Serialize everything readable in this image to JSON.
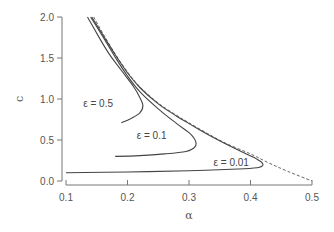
{
  "chart_data": {
    "type": "line",
    "title": "",
    "xlabel": "α",
    "ylabel": "c",
    "xlim": [
      0.1,
      0.5
    ],
    "ylim": [
      0.0,
      2.0
    ],
    "xticks": [
      "0.1",
      "0.2",
      "0.3",
      "0.4",
      "0.5"
    ],
    "yticks": [
      "0.0",
      "0.5",
      "1.0",
      "1.5",
      "2.0"
    ],
    "grid": false,
    "legend": "none",
    "series": [
      {
        "name": "limit",
        "style": "dashed",
        "points": [
          [
            0.145,
            2.0
          ],
          [
            0.16,
            1.8
          ],
          [
            0.18,
            1.55
          ],
          [
            0.2,
            1.33
          ],
          [
            0.22,
            1.15
          ],
          [
            0.25,
            0.95
          ],
          [
            0.28,
            0.8
          ],
          [
            0.3,
            0.71
          ],
          [
            0.33,
            0.58
          ],
          [
            0.36,
            0.46
          ],
          [
            0.4,
            0.33
          ],
          [
            0.43,
            0.22
          ],
          [
            0.46,
            0.12
          ],
          [
            0.5,
            0.0
          ]
        ]
      },
      {
        "name": "ε = 0.01",
        "style": "solid",
        "points": [
          [
            0.142,
            2.0
          ],
          [
            0.16,
            1.78
          ],
          [
            0.18,
            1.54
          ],
          [
            0.2,
            1.32
          ],
          [
            0.22,
            1.14
          ],
          [
            0.25,
            0.94
          ],
          [
            0.28,
            0.79
          ],
          [
            0.3,
            0.7
          ],
          [
            0.33,
            0.57
          ],
          [
            0.36,
            0.45
          ],
          [
            0.39,
            0.34
          ],
          [
            0.41,
            0.27
          ],
          [
            0.42,
            0.21
          ],
          [
            0.415,
            0.17
          ],
          [
            0.39,
            0.15
          ],
          [
            0.3,
            0.125
          ],
          [
            0.2,
            0.11
          ],
          [
            0.1,
            0.1
          ]
        ]
      },
      {
        "name": "ε = 0.1",
        "style": "solid",
        "points": [
          [
            0.14,
            2.0
          ],
          [
            0.16,
            1.76
          ],
          [
            0.18,
            1.51
          ],
          [
            0.2,
            1.28
          ],
          [
            0.22,
            1.09
          ],
          [
            0.25,
            0.88
          ],
          [
            0.28,
            0.7
          ],
          [
            0.3,
            0.59
          ],
          [
            0.31,
            0.5
          ],
          [
            0.31,
            0.42
          ],
          [
            0.295,
            0.36
          ],
          [
            0.26,
            0.33
          ],
          [
            0.22,
            0.31
          ],
          [
            0.18,
            0.3
          ]
        ]
      },
      {
        "name": "ε = 0.5",
        "style": "solid",
        "points": [
          [
            0.135,
            2.0
          ],
          [
            0.15,
            1.8
          ],
          [
            0.17,
            1.55
          ],
          [
            0.19,
            1.35
          ],
          [
            0.21,
            1.15
          ],
          [
            0.22,
            1.02
          ],
          [
            0.225,
            0.92
          ],
          [
            0.22,
            0.83
          ],
          [
            0.205,
            0.76
          ],
          [
            0.19,
            0.71
          ]
        ]
      }
    ],
    "annotations": [
      {
        "text": "ε = 0.5",
        "x": 0.128,
        "y": 0.95
      },
      {
        "text": "ε = 0.1",
        "x": 0.215,
        "y": 0.55
      },
      {
        "text": "ε = 0.01",
        "x": 0.34,
        "y": 0.23
      }
    ]
  }
}
